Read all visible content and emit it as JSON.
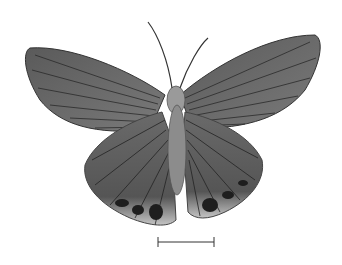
{
  "image": {
    "subject": "butterfly specimen, dorsal view, grayscale",
    "background": "#ffffff",
    "wing_color": "#6e6e6e",
    "vein_color": "#2a2a2a",
    "margin_color": "#bdbdbd"
  },
  "scale_bar": {
    "x1": 158,
    "x2": 214,
    "y": 242,
    "label": ""
  }
}
